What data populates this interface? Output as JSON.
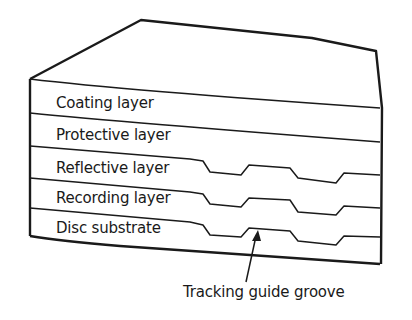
{
  "diagram": {
    "layers": [
      {
        "label": "Coating layer"
      },
      {
        "label": "Protective layer"
      },
      {
        "label": "Reflective layer"
      },
      {
        "label": "Recording layer"
      },
      {
        "label": "Disc substrate"
      }
    ],
    "annotation": {
      "label": "Tracking guide groove"
    },
    "colors": {
      "line": "#1a1a1a",
      "background": "#ffffff"
    }
  }
}
